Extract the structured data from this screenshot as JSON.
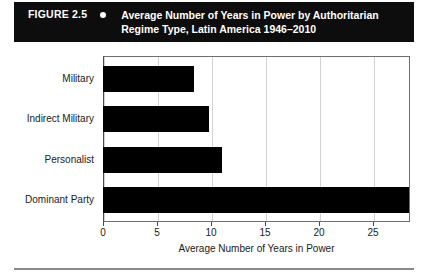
{
  "figure": {
    "number_label": "FIGURE 2.5",
    "bullet_icon": "bullet-dot-icon",
    "title_line1": "Average Number of Years in Power by Authoritarian",
    "title_line2": "Regime Type, Latin America 1946–2010",
    "banner_bg": "#0d0d0d",
    "banner_fg": "#ffffff"
  },
  "chart_data": {
    "type": "bar",
    "orientation": "horizontal",
    "title": "Average Number of Years in Power by Authoritarian Regime Type, Latin America 1946–2010",
    "categories": [
      "Military",
      "Indirect Military",
      "Personalist",
      "Dominant Party"
    ],
    "values": [
      7.4,
      8.6,
      9.7,
      24.9
    ],
    "series": [
      {
        "name": "Average Number of Years in Power",
        "values": [
          7.4,
          8.6,
          9.7,
          24.9
        ]
      }
    ],
    "xlabel": "Average Number of Years in Power",
    "ylabel": "",
    "xlim": [
      0,
      25
    ],
    "ylim": null,
    "xticks": [
      0,
      5,
      10,
      15,
      20,
      25
    ],
    "xtick_labels": [
      "0",
      "5",
      "10",
      "15",
      "20",
      "25"
    ],
    "grid": "vertical",
    "legend": "none",
    "bar_color": "#000000",
    "gridline_color": "#d2d2d2",
    "plot_border_color": "#6e6e6e"
  }
}
